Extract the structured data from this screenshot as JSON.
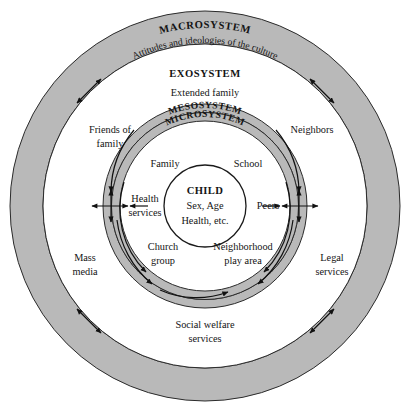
{
  "diagram": {
    "center_x": 205,
    "center_y": 206,
    "colors": {
      "band_gray": "#b9b9b9",
      "background": "#ffffff",
      "outline": "#2b2b2b",
      "text": "#141414"
    },
    "rings": [
      {
        "name": "macrosystem",
        "outer_r": 195,
        "inner_r": 162,
        "filled": true
      },
      {
        "name": "exosystem",
        "outer_r": 162,
        "inner_r": 102,
        "filled": false
      },
      {
        "name": "mesosystem",
        "outer_r": 102,
        "inner_r": 93,
        "filled": true
      },
      {
        "name": "microsystem",
        "outer_r": 93,
        "inner_r": 85,
        "filled": true
      },
      {
        "name": "inner-field",
        "outer_r": 85,
        "inner_r": 41,
        "filled": false
      },
      {
        "name": "child-core",
        "outer_r": 41,
        "inner_r": 0,
        "filled": false
      }
    ]
  },
  "labels": {
    "macrosystem": "MACROSYSTEM",
    "macrosystem_sub": "Attitudes and ideologies of the culture",
    "exosystem": "EXOSYSTEM",
    "exosystem_sub": "Extended family",
    "mesosystem": "MESOSYSTEM",
    "microsystem": "MICROSYSTEM"
  },
  "child": {
    "title": "CHILD",
    "line1": "Sex, Age",
    "line2": "Health, etc."
  },
  "microsystem_items": [
    {
      "id": "family",
      "text": "Family"
    },
    {
      "id": "school",
      "text": "School"
    },
    {
      "id": "health-services",
      "line1": "Health",
      "line2": "services"
    },
    {
      "id": "peers",
      "text": "Peers"
    },
    {
      "id": "church-group",
      "line1": "Church",
      "line2": "group"
    },
    {
      "id": "neighborhood-play-area",
      "line1": "Neighborhood",
      "line2": "play area"
    }
  ],
  "exosystem_items": [
    {
      "id": "friends-of-family",
      "line1": "Friends of",
      "line2": "family"
    },
    {
      "id": "neighbors",
      "text": "Neighbors"
    },
    {
      "id": "mass-media",
      "line1": "Mass",
      "line2": "media"
    },
    {
      "id": "legal-services",
      "line1": "Legal",
      "line2": "services"
    },
    {
      "id": "social-welfare-services",
      "line1": "Social welfare",
      "line2": "services"
    }
  ]
}
